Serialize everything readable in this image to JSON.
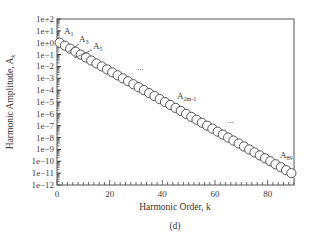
{
  "chart_data": {
    "type": "scatter",
    "title": "",
    "caption": "(d)",
    "xlabel": "Harmonic Order, k",
    "ylabel": "Harmonic Amplitude, A_k",
    "xlim": [
      0,
      90
    ],
    "ylim_log10": [
      -12,
      2
    ],
    "yscale": "log",
    "grid": false,
    "x_ticks": [
      0,
      20,
      40,
      60,
      80
    ],
    "y_tick_labels": [
      "1e+2",
      "1e+1",
      "1e+0",
      "1e−1",
      "1e−2",
      "1e−3",
      "1e−4",
      "1e−5",
      "1e−6",
      "1e−7",
      "1e−8",
      "1e−9",
      "1e−10",
      "1e−11",
      "1e−12"
    ],
    "series": [
      {
        "name": "A_k (odd harmonics)",
        "marker": "open circle",
        "x": [
          1,
          3,
          5,
          7,
          9,
          11,
          13,
          15,
          17,
          19,
          21,
          23,
          25,
          27,
          29,
          31,
          33,
          35,
          37,
          39,
          41,
          43,
          45,
          47,
          49,
          51,
          53,
          55,
          57,
          59,
          61,
          63,
          65,
          67,
          69,
          71,
          73,
          75,
          77,
          79,
          81,
          83,
          85,
          87,
          89
        ],
        "log10_values": [
          0,
          -0.25,
          -0.5,
          -0.75,
          -1,
          -1.25,
          -1.5,
          -1.75,
          -2,
          -2.25,
          -2.5,
          -2.75,
          -3,
          -3.25,
          -3.5,
          -3.75,
          -4,
          -4.25,
          -4.5,
          -4.75,
          -5,
          -5.25,
          -5.5,
          -5.75,
          -6,
          -6.25,
          -6.5,
          -6.75,
          -7,
          -7.25,
          -7.5,
          -7.75,
          -8,
          -8.25,
          -8.5,
          -8.75,
          -9,
          -9.25,
          -9.5,
          -9.75,
          -10,
          -10.25,
          -10.5,
          -10.75,
          -11
        ]
      }
    ],
    "annotations": [
      {
        "base": "A",
        "sub": "1",
        "x": 1
      },
      {
        "base": "A",
        "sub": "3",
        "x": 3
      },
      {
        "base": "A",
        "sub": "5",
        "x": 5
      },
      {
        "base": "A",
        "sub": "2m-1",
        "x": 47
      },
      {
        "base": "A",
        "sub": "89",
        "x": 89
      },
      {
        "text": "...",
        "position": "upper-middle"
      },
      {
        "text": "...",
        "position": "lower-right"
      }
    ]
  }
}
